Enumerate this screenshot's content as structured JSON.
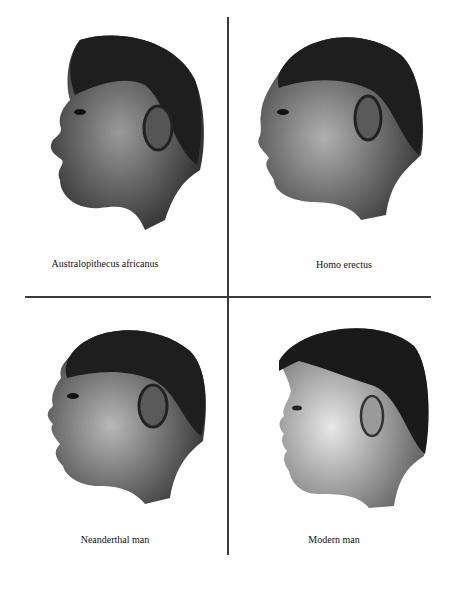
{
  "figure": {
    "panels": [
      {
        "id": "australopithecus",
        "caption": "Australopithecus africanus",
        "position": "top-left"
      },
      {
        "id": "homo-erectus",
        "caption": "Homo erectus",
        "position": "top-right"
      },
      {
        "id": "neanderthal",
        "caption": "Neanderthal man",
        "position": "bottom-left"
      },
      {
        "id": "modern",
        "caption": "Modern man",
        "position": "bottom-right"
      }
    ],
    "colors": {
      "background": "#ffffff",
      "divider": "#3a3a3a",
      "hair": "#1e1e1e",
      "skin": "#8a8a8a",
      "text": "#111111"
    }
  }
}
